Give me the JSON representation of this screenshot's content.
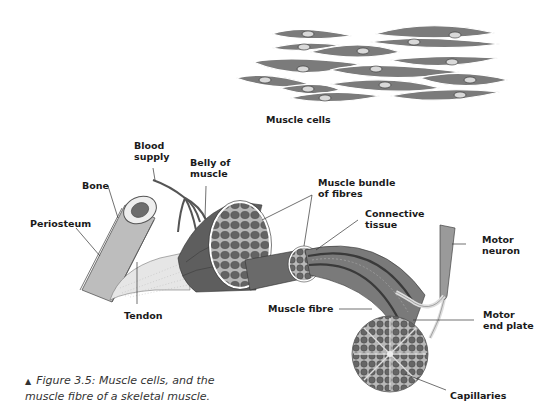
{
  "figure": {
    "top_panel": {
      "title": "Muscle cells",
      "cell_count": 15
    },
    "labels": {
      "blood_supply": [
        "Blood",
        "supply"
      ],
      "bone": "Bone",
      "belly_of_muscle": [
        "Belly of",
        "muscle"
      ],
      "periosteum": "Periosteum",
      "muscle_bundle": [
        "Muscle bundle",
        "of fibres"
      ],
      "connective_tissue": [
        "Connective",
        "tissue"
      ],
      "motor_neuron": [
        "Motor",
        "neuron"
      ],
      "tendon": "Tendon",
      "muscle_fibre": "Muscle fibre",
      "motor_end_plate": [
        "Motor",
        "end plate"
      ],
      "capillaries": "Capillaries"
    },
    "caption": {
      "marker": "▲",
      "line1": "Figure 3.5: Muscle cells, and the",
      "line2": "muscle fibre of a skeletal muscle."
    },
    "colors": {
      "muscle_dark": "#5a5a5a",
      "muscle_mid": "#7a7a7a",
      "muscle_light": "#9a9a9a",
      "bone": "#bdbdbd",
      "tendon": "#e6e6e6",
      "label_text": "#1a1a1a",
      "leader_line": "#333333"
    }
  }
}
